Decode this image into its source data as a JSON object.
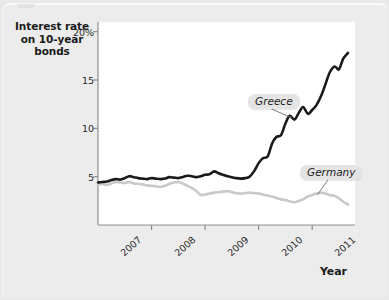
{
  "chart_data": {
    "type": "line",
    "title": "",
    "ylabel": "Interest rate on 10-year bonds",
    "xlabel": "Year",
    "ylim": [
      0,
      21
    ],
    "xlim": [
      2007.0,
      2011.8
    ],
    "grid": false,
    "legend_position": "inline-callouts",
    "y_ticks": [
      {
        "value": 20,
        "label": "20%"
      },
      {
        "value": 15,
        "label": "15"
      },
      {
        "value": 10,
        "label": "10"
      },
      {
        "value": 5,
        "label": "5"
      }
    ],
    "x_ticks": [
      {
        "value": 2007,
        "label": "2007"
      },
      {
        "value": 2008,
        "label": "2008"
      },
      {
        "value": 2009,
        "label": "2009"
      },
      {
        "value": 2010,
        "label": "2010"
      },
      {
        "value": 2011,
        "label": "2011"
      }
    ],
    "series": [
      {
        "name": "Greece",
        "color": "#1a1a1a",
        "width": 2.6,
        "x": [
          2007.0,
          2007.08,
          2007.17,
          2007.25,
          2007.33,
          2007.42,
          2007.5,
          2007.58,
          2007.67,
          2007.75,
          2007.83,
          2007.92,
          2008.0,
          2008.08,
          2008.17,
          2008.25,
          2008.33,
          2008.42,
          2008.5,
          2008.58,
          2008.67,
          2008.75,
          2008.83,
          2008.92,
          2009.0,
          2009.08,
          2009.17,
          2009.25,
          2009.33,
          2009.42,
          2009.5,
          2009.58,
          2009.67,
          2009.75,
          2009.83,
          2009.92,
          2010.0,
          2010.08,
          2010.17,
          2010.25,
          2010.33,
          2010.42,
          2010.5,
          2010.58,
          2010.67,
          2010.75,
          2010.83,
          2010.92,
          2011.0,
          2011.08,
          2011.17,
          2011.25,
          2011.33,
          2011.42,
          2011.5,
          2011.58,
          2011.67
        ],
        "values": [
          4.4,
          4.45,
          4.5,
          4.65,
          4.75,
          4.7,
          4.85,
          5.05,
          4.95,
          4.85,
          4.8,
          4.75,
          4.85,
          4.8,
          4.75,
          4.8,
          4.95,
          4.9,
          4.85,
          4.95,
          5.1,
          5.05,
          4.95,
          5.05,
          5.2,
          5.25,
          5.55,
          5.35,
          5.2,
          5.05,
          4.95,
          4.85,
          4.8,
          4.85,
          5.0,
          5.6,
          6.4,
          6.9,
          7.1,
          8.4,
          9.1,
          9.3,
          10.5,
          11.3,
          10.9,
          11.6,
          12.2,
          11.5,
          11.9,
          12.4,
          13.4,
          14.6,
          15.8,
          16.4,
          16.1,
          17.2,
          17.8
        ]
      },
      {
        "name": "Germany",
        "color": "#c9c9c9",
        "width": 2.6,
        "x": [
          2007.0,
          2007.08,
          2007.17,
          2007.25,
          2007.33,
          2007.42,
          2007.5,
          2007.58,
          2007.67,
          2007.75,
          2007.83,
          2007.92,
          2008.0,
          2008.08,
          2008.17,
          2008.25,
          2008.33,
          2008.42,
          2008.5,
          2008.58,
          2008.67,
          2008.75,
          2008.83,
          2008.92,
          2009.0,
          2009.08,
          2009.17,
          2009.25,
          2009.33,
          2009.42,
          2009.5,
          2009.58,
          2009.67,
          2009.75,
          2009.83,
          2009.92,
          2010.0,
          2010.08,
          2010.17,
          2010.25,
          2010.33,
          2010.42,
          2010.5,
          2010.58,
          2010.67,
          2010.75,
          2010.83,
          2010.92,
          2011.0,
          2011.08,
          2011.17,
          2011.25,
          2011.33,
          2011.42,
          2011.5,
          2011.58,
          2011.67
        ],
        "values": [
          4.2,
          4.25,
          4.15,
          4.3,
          4.45,
          4.4,
          4.35,
          4.45,
          4.3,
          4.25,
          4.2,
          4.1,
          4.05,
          4.0,
          3.95,
          4.05,
          4.25,
          4.4,
          4.45,
          4.3,
          4.05,
          3.85,
          3.55,
          3.1,
          3.15,
          3.25,
          3.35,
          3.4,
          3.45,
          3.5,
          3.4,
          3.3,
          3.25,
          3.3,
          3.35,
          3.3,
          3.25,
          3.15,
          3.05,
          2.95,
          2.8,
          2.65,
          2.6,
          2.45,
          2.35,
          2.5,
          2.65,
          2.95,
          3.1,
          3.25,
          3.35,
          3.25,
          3.1,
          3.0,
          2.75,
          2.4,
          2.1
        ]
      }
    ],
    "annotations": [
      {
        "text": "Greece",
        "target_x": 2010.62,
        "target_y": 11.1
      },
      {
        "text": "Germany",
        "target_x": 2011.1,
        "target_y": 3.15
      }
    ]
  }
}
